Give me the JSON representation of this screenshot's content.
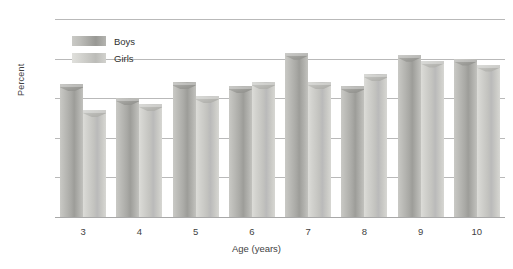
{
  "chart_data": {
    "type": "bar",
    "title": "",
    "xlabel": "Age (years)",
    "ylabel": "Percent",
    "categories": [
      "3",
      "4",
      "5",
      "6",
      "7",
      "8",
      "9",
      "10"
    ],
    "series": [
      {
        "name": "Boys",
        "values": [
          67,
          60,
          68,
          66,
          83,
          66,
          82,
          80
        ]
      },
      {
        "name": "Girls",
        "values": [
          54,
          57,
          61,
          68,
          68,
          72,
          79,
          77
        ]
      }
    ],
    "ylim": [
      0,
      100
    ],
    "ytick_labels": [
      "0",
      "20",
      "40",
      "60",
      "80",
      "100"
    ],
    "ytick_values": [
      0,
      20,
      40,
      60,
      80,
      100
    ],
    "grid": "horizontal",
    "legend_position": "top-left-inside",
    "colors": {
      "boys": "#a4a4a0",
      "girls": "#c8c8c4",
      "gridline": "#b9b9b9",
      "text": "#3f3f3f",
      "background": "#ffffff"
    }
  },
  "legend": {
    "items": [
      {
        "label": "Boys",
        "swatch": "boys-swatch"
      },
      {
        "label": "Girls",
        "swatch": "girls-swatch"
      }
    ]
  },
  "axes": {
    "y_title": "Percent",
    "x_title": "Age (years)"
  }
}
